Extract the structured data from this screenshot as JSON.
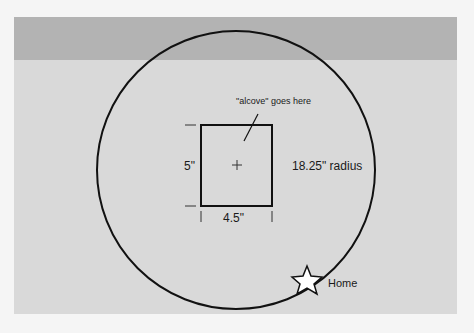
{
  "diagram": {
    "annotation": "\"alcove\" goes here",
    "height_label": "5\"",
    "width_label": "4.5\"",
    "radius_label": "18.25\" radius",
    "home_label": "Home"
  },
  "colors": {
    "band": "#b3b3b3",
    "panel": "#d9d9d9",
    "stroke": "#111111"
  }
}
